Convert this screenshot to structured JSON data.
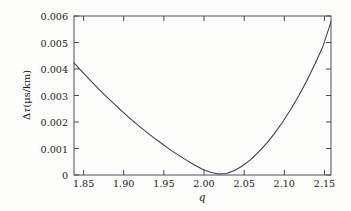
{
  "chart_data": {
    "type": "line",
    "title": "",
    "xlabel": "q",
    "ylabel": "Δτ(μs/km)",
    "xlim": [
      1.838,
      2.158
    ],
    "ylim": [
      0,
      0.006
    ],
    "grid": false,
    "legend": null,
    "xticks": [
      1.85,
      1.9,
      1.95,
      2.0,
      2.05,
      2.1,
      2.15
    ],
    "xtick_labels": [
      "1.85",
      "1.90",
      "1.95",
      "2.00",
      "2.05",
      "2.10",
      "2.15"
    ],
    "yticks": [
      0,
      0.001,
      0.002,
      0.003,
      0.004,
      0.005,
      0.006
    ],
    "ytick_labels": [
      "0",
      "0.001",
      "0.002",
      "0.003",
      "0.004",
      "0.005",
      "0.006"
    ],
    "line_color": "#3b3b55",
    "line_width": 1.0,
    "minimum": {
      "x": 1.98,
      "y": 0.0
    },
    "series": [
      {
        "name": "delta-tau",
        "x": [
          1.838,
          1.848,
          1.858,
          1.868,
          1.878,
          1.888,
          1.898,
          1.908,
          1.918,
          1.928,
          1.938,
          1.948,
          1.958,
          1.968,
          1.978,
          1.988,
          1.998,
          2.008,
          2.018,
          2.028,
          2.038,
          2.048,
          2.058,
          2.068,
          2.078,
          2.088,
          2.098,
          2.108,
          2.118,
          2.128,
          2.138,
          2.148,
          2.158
        ],
        "y": [
          0.00423,
          0.0039,
          0.00358,
          0.00327,
          0.00297,
          0.00268,
          0.0024,
          0.00213,
          0.00187,
          0.00163,
          0.00139,
          0.00117,
          0.00095,
          0.00075,
          0.00056,
          0.00038,
          0.00022,
          0.0001,
          4e-05,
          6e-05,
          0.00017,
          0.00035,
          0.00058,
          0.00087,
          0.0012,
          0.00158,
          0.00201,
          0.00248,
          0.003,
          0.00357,
          0.00419,
          0.00486,
          0.00578
        ]
      }
    ]
  },
  "axes": {
    "x_title": "q",
    "y_title_delta": "Δ",
    "y_title_tau": "τ",
    "y_title_units": "(μs/km)"
  }
}
